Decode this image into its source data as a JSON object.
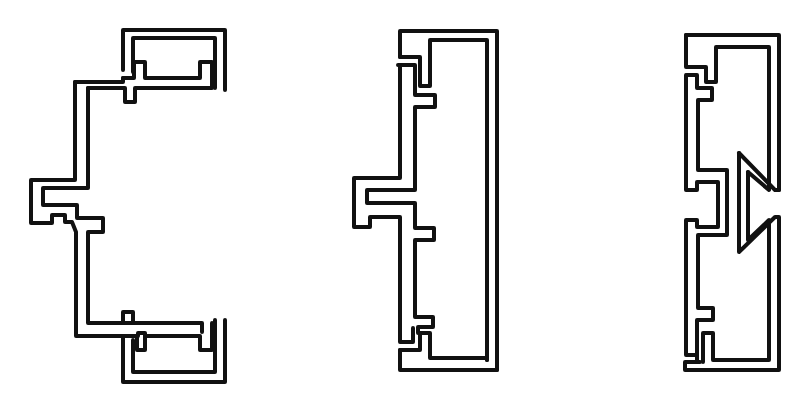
{
  "canvas": {
    "width": 802,
    "height": 397,
    "background": "#ffffff",
    "stroke_color": "#111111",
    "stroke_width": 4
  },
  "profiles": [
    {
      "name": "profile-1-c-channel",
      "paths": [
        "M123,70 L123,30 L225,30 L225,90",
        "M133,72 L133,38 L215,38 L215,88",
        "M75,82 L75,180 L31,180 L31,223 L52,223 L52,215 L65,215 L65,222 L72,222 L76,232 L76,336 L123,336",
        "M88,88 L88,188 L43,188 L43,205 L77,205 L77,218 L103,218 L103,232 L88,232 L88,323 L202,323 L202,332",
        "M75,82 L123,82 L123,78",
        "M88,88 L125,88 L125,102 L135,102 L135,88 L212,88 L212,62 L200,62 L200,78 L145,78 L145,62 L134,62 L134,78 L123,78",
        "M123,336 L138,336 L138,333 L145,333 L145,350 L137,350 L137,336",
        "M145,336 L200,336 L200,350 L212,350 L212,323",
        "M123,338 L123,382 L225,382 L225,320",
        "M133,340 L133,372 L215,372 L215,320",
        "M123,323 L123,312 L133,312 L133,323"
      ]
    },
    {
      "name": "profile-2-closed-frame",
      "paths": [
        "M400,57 L400,31 L497,31 L497,370",
        "M400,57 L420,57 L420,86 L430,86 L430,40 L487,40 L487,360",
        "M398,65 L415,65 L415,95 L435,95 L435,107 L415,107 L415,190 L367,190 L367,203 L415,203 L415,228 L434,228 L434,240 L415,240 L415,317 L433,317 L433,327 L418,327 L418,333",
        "M400,65 L400,178 L354,178 L354,227 L370,227 L370,217 L400,217 L400,342 L413,342 L413,328",
        "M400,350 L400,370 L497,370",
        "M400,350 L420,350 L420,333 L430,333 L430,358 L487,358 L487,360"
      ]
    },
    {
      "name": "profile-3-interlocking-frame",
      "paths": [
        "M686,35 L779,35 L779,190",
        "M686,35 L686,67 L706,67 L706,82 L716,82 L716,47 L769,47 L769,178",
        "M687,75 L697,75 L697,88 L712,88 L712,100 L698,100 L698,170 L727,170 L727,235 L698,235 L698,308 L713,308 L713,320 L697,320 L697,362",
        "M686,75 L686,190 L697,190 L697,182 L718,182 L718,227 L697,227 L697,220 L686,220 L686,355 L695,355",
        "M739,153 L739,252 L775,217 L779,217 L779,370 L685,370 L685,362 L700,362",
        "M739,153 L775,190 L779,190",
        "M748,172 L748,240 L769,220 L769,360 L713,360 L713,333 L703,333 L703,362",
        "M748,172 L769,190 L769,178"
      ]
    }
  ]
}
